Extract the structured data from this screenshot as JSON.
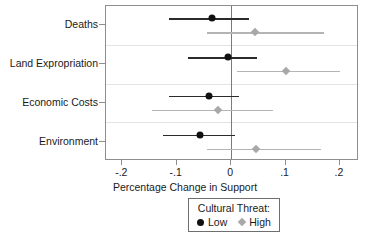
{
  "chart_data": {
    "type": "scatter",
    "title": "",
    "xlabel": "Percentage Change in Support",
    "ylabel": "",
    "xlim": [
      -0.23,
      0.235
    ],
    "xticks": [
      -0.2,
      -0.1,
      0,
      0.1,
      0.2
    ],
    "xticklabels": [
      "-.2",
      "-.1",
      "0",
      ".1",
      ".2"
    ],
    "categories": [
      "Deaths",
      "Land Expropriation",
      "Economic Costs",
      "Environment"
    ],
    "grid": true,
    "zero_reference_line": 0,
    "legend": {
      "title": "Cultural Threat:",
      "position": "below-axis-center",
      "entries": [
        {
          "label": "Low",
          "marker": "circle",
          "color": "#111111"
        },
        {
          "label": "High",
          "marker": "diamond",
          "color": "#a8a8a8"
        }
      ]
    },
    "series": [
      {
        "name": "Low",
        "marker": "circle",
        "color": "#111111",
        "values": [
          -0.035,
          -0.005,
          -0.04,
          -0.057
        ],
        "ci_low": [
          -0.115,
          -0.08,
          -0.115,
          -0.125
        ],
        "ci_high": [
          0.033,
          0.048,
          0.015,
          0.008
        ]
      },
      {
        "name": "High",
        "marker": "diamond",
        "color": "#a8a8a8",
        "values": [
          0.043,
          0.1,
          -0.025,
          0.045
        ],
        "ci_low": [
          -0.044,
          0.01,
          -0.145,
          -0.045
        ],
        "ci_high": [
          0.17,
          0.2,
          0.077,
          0.165
        ]
      }
    ]
  }
}
